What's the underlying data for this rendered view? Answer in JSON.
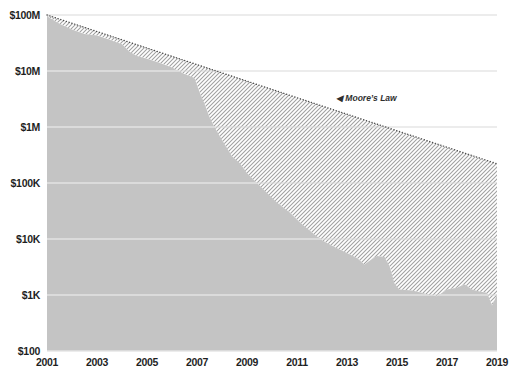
{
  "chart_data": {
    "type": "area",
    "y_axis": {
      "scale": "log",
      "range": [
        100,
        100000000
      ],
      "gridlines": true,
      "ticks": [
        {
          "label": "$100M",
          "value": 100000000
        },
        {
          "label": "$10M",
          "value": 10000000
        },
        {
          "label": "$1M",
          "value": 1000000
        },
        {
          "label": "$100K",
          "value": 100000
        },
        {
          "label": "$10K",
          "value": 10000
        },
        {
          "label": "$1K",
          "value": 1000
        },
        {
          "label": "$100",
          "value": 100
        }
      ]
    },
    "x_axis": {
      "range": [
        2001,
        2019
      ],
      "ticks": [
        {
          "label": "2001",
          "year": 2001
        },
        {
          "label": "2003",
          "year": 2003
        },
        {
          "label": "2005",
          "year": 2005
        },
        {
          "label": "2007",
          "year": 2007
        },
        {
          "label": "2009",
          "year": 2009
        },
        {
          "label": "2011",
          "year": 2011
        },
        {
          "label": "2013",
          "year": 2013
        },
        {
          "label": "2015",
          "year": 2015
        },
        {
          "label": "2017",
          "year": 2017
        },
        {
          "label": "2019",
          "year": 2019
        }
      ]
    },
    "series": [
      {
        "name": "cost-per-genome",
        "style": "area",
        "color": "#c4c4c4",
        "points": [
          [
            2001.0,
            95000000
          ],
          [
            2001.5,
            70000000
          ],
          [
            2002.0,
            55000000
          ],
          [
            2002.5,
            46000000
          ],
          [
            2003.0,
            43000000
          ],
          [
            2003.5,
            36000000
          ],
          [
            2004.0,
            30000000
          ],
          [
            2004.3,
            22000000
          ],
          [
            2004.6,
            18500000
          ],
          [
            2005.0,
            16500000
          ],
          [
            2005.5,
            14000000
          ],
          [
            2006.0,
            11500000
          ],
          [
            2006.5,
            8800000
          ],
          [
            2006.9,
            7500000
          ],
          [
            2007.1,
            4200000
          ],
          [
            2007.3,
            2600000
          ],
          [
            2007.5,
            1500000
          ],
          [
            2007.7,
            1000000
          ],
          [
            2007.9,
            700000
          ],
          [
            2008.1,
            500000
          ],
          [
            2008.4,
            300000
          ],
          [
            2008.7,
            230000
          ],
          [
            2009.0,
            150000
          ],
          [
            2009.4,
            100000
          ],
          [
            2009.8,
            67000
          ],
          [
            2010.2,
            45000
          ],
          [
            2010.7,
            30000
          ],
          [
            2011.1,
            20000
          ],
          [
            2011.6,
            13000
          ],
          [
            2012.0,
            9500
          ],
          [
            2012.5,
            7200
          ],
          [
            2013.0,
            5600
          ],
          [
            2013.4,
            4600
          ],
          [
            2013.7,
            3500
          ],
          [
            2014.0,
            4400
          ],
          [
            2014.2,
            5000
          ],
          [
            2014.5,
            4800
          ],
          [
            2014.7,
            3300
          ],
          [
            2014.9,
            1600
          ],
          [
            2015.1,
            1250
          ],
          [
            2015.6,
            1200
          ],
          [
            2016.0,
            1100
          ],
          [
            2016.3,
            1000
          ],
          [
            2016.6,
            950
          ],
          [
            2017.0,
            1250
          ],
          [
            2017.4,
            1350
          ],
          [
            2017.7,
            1550
          ],
          [
            2018.0,
            1250
          ],
          [
            2018.3,
            1150
          ],
          [
            2018.6,
            1100
          ],
          [
            2018.8,
            650
          ],
          [
            2019.0,
            1000
          ]
        ]
      },
      {
        "name": "moores-law",
        "style": "dotted-line",
        "color": "#4d4d4d",
        "points": [
          [
            2001.0,
            100000000
          ],
          [
            2019.0,
            220000
          ]
        ]
      }
    ],
    "gap_fill": {
      "between": [
        "moores-law",
        "cost-per-genome"
      ],
      "pattern": "diagonal-hatch",
      "hatch_color": "#a0a0a0"
    },
    "annotation": {
      "text": "◀ Moore’s Law",
      "year": 2012.55,
      "value": 3200000
    },
    "colors": {
      "background": "#ffffff",
      "gridline": "#d9d9d9",
      "gridline_over_area": "#f2f2f2",
      "tick_text": "#1f1f1f"
    }
  }
}
